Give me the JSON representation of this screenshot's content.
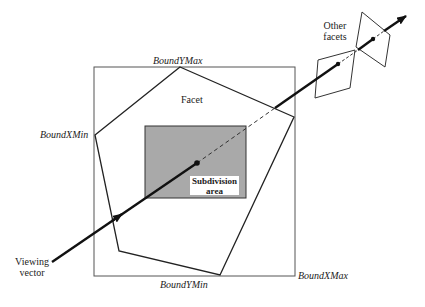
{
  "labels": {
    "bound_y_max": "BoundYMax",
    "bound_x_min": "BoundXMin",
    "bound_x_max": "BoundXMax",
    "bound_y_min": "BoundYMin",
    "facet": "Facet",
    "subdivision_line1": "Subdivision",
    "subdivision_line2": "area",
    "other_facets_line1": "Other",
    "other_facets_line2": "facets",
    "viewing_vector_line1": "Viewing",
    "viewing_vector_line2": "vector"
  },
  "colors": {
    "line": "#222222",
    "box": "#555555",
    "subdivision_fill": "#a9a9a9",
    "label_bg": "#ffffff"
  }
}
